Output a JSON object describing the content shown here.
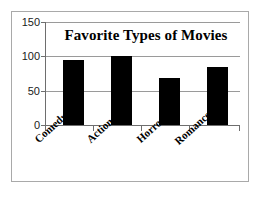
{
  "chart_data": {
    "type": "bar",
    "title": "Favorite Types of Movies",
    "categories": [
      "Comedy",
      "Action",
      "Horror",
      "Romance"
    ],
    "values": [
      95,
      100,
      68,
      85
    ],
    "xlabel": "",
    "ylabel": "",
    "ylim": [
      0,
      150
    ],
    "yticks": [
      0,
      50,
      100,
      150
    ],
    "ytick_labels": [
      "0",
      "50",
      "100",
      "150"
    ],
    "grid": true,
    "legend": false,
    "bar_color": "#000000",
    "grid_color": "#9a9a9a",
    "axis_color": "#6e6e6e",
    "frame_color": "#a9a9a9",
    "background": "#ffffff"
  },
  "axis": {
    "tick_0": "0",
    "tick_50": "50",
    "tick_100": "100",
    "tick_150": "150"
  },
  "categories": {
    "c0": "Comedy",
    "c1": "Action",
    "c2": "Horror",
    "c3": "Romance"
  }
}
